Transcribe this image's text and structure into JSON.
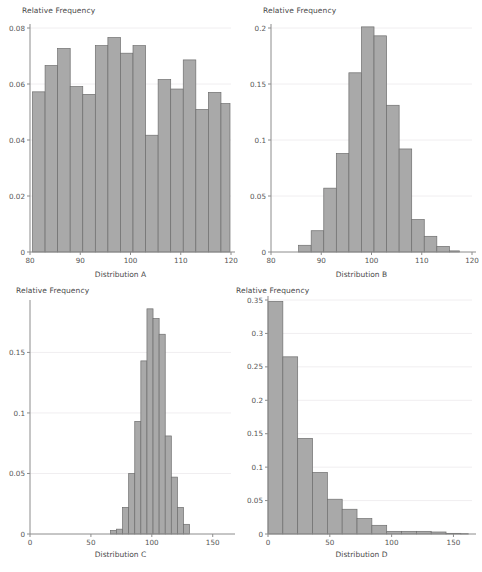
{
  "figure": {
    "background": "#ffffff",
    "bar_fill": "#a9a9a9",
    "bar_stroke": "#6e6e6e",
    "axis_color": "#8c8c8c",
    "grid_color": "#f0eef0",
    "text_color": "#4a4a4a",
    "layout": "2x2 grid of histograms"
  },
  "chart_data": [
    {
      "id": "A",
      "type": "bar",
      "title": "",
      "xlabel": "Distribution A",
      "ylabel": "Relative Frequency",
      "xlim": [
        80,
        120
      ],
      "ylim": [
        0,
        0.08
      ],
      "xticks": [
        80,
        90,
        100,
        110,
        120
      ],
      "xtick_labels": [
        "80",
        "90",
        "100",
        "110",
        "120"
      ],
      "yticks": [
        0,
        0.02,
        0.04,
        0.06,
        0.08
      ],
      "ytick_labels": [
        "0",
        "0.02",
        "0.04",
        "0.06",
        "0.08"
      ],
      "grid": true,
      "shape": "uniform",
      "bin_edges": [
        80.5,
        83,
        85.5,
        88,
        90.5,
        93,
        95.5,
        98,
        100.5,
        103,
        105.5,
        108,
        110.5,
        113,
        115.5,
        118,
        119.8
      ],
      "categories": [
        "80.5-83",
        "83-85.5",
        "85.5-88",
        "88-90.5",
        "90.5-93",
        "93-95.5",
        "95.5-98",
        "98-100.5",
        "100.5-103",
        "103-105.5",
        "105.5-108",
        "108-110.5",
        "110.5-113",
        "113-115.5",
        "115.5-118",
        "118-119.8"
      ],
      "values": [
        0.0572,
        0.0666,
        0.0727,
        0.0591,
        0.0563,
        0.0737,
        0.0766,
        0.071,
        0.0737,
        0.0417,
        0.0616,
        0.0582,
        0.0686,
        0.0509,
        0.057,
        0.053
      ]
    },
    {
      "id": "B",
      "type": "bar",
      "title": "",
      "xlabel": "Distribution B",
      "ylabel": "Relative Frequency",
      "xlim": [
        80,
        120
      ],
      "ylim": [
        0,
        0.2
      ],
      "xticks": [
        80,
        90,
        100,
        110,
        120
      ],
      "xtick_labels": [
        "80",
        "90",
        "100",
        "110",
        "120"
      ],
      "yticks": [
        0,
        0.05,
        0.1,
        0.15,
        0.2
      ],
      "ytick_labels": [
        "0",
        "0.05",
        "0.1",
        "0.15",
        "0.2"
      ],
      "grid": true,
      "shape": "normal-bell",
      "bin_edges": [
        85.5,
        88,
        90.5,
        93,
        95.5,
        98,
        100.5,
        103,
        105.5,
        108,
        110.5,
        113,
        115.5,
        117.5
      ],
      "categories": [
        "85.5-88",
        "88-90.5",
        "90.5-93",
        "93-95.5",
        "95.5-98",
        "98-100.5",
        "100.5-103",
        "103-105.5",
        "105.5-108",
        "108-110.5",
        "110.5-113",
        "113-115.5",
        "115.5-117.5"
      ],
      "values": [
        0.006,
        0.019,
        0.057,
        0.088,
        0.16,
        0.201,
        0.193,
        0.131,
        0.092,
        0.029,
        0.014,
        0.005,
        0.001
      ]
    },
    {
      "id": "C",
      "type": "bar",
      "title": "",
      "xlabel": "Distribution C",
      "ylabel": "Relative Frequency",
      "xlim": [
        0,
        165
      ],
      "ylim": [
        0,
        0.19
      ],
      "xticks": [
        0,
        50,
        100,
        150
      ],
      "xtick_labels": [
        "0",
        "50",
        "100",
        "150"
      ],
      "yticks": [
        0,
        0.05,
        0.1,
        0.15
      ],
      "ytick_labels": [
        "0",
        "0.05",
        "0.1",
        "0.15"
      ],
      "grid": true,
      "shape": "narrow-peaked",
      "bin_edges": [
        66,
        71,
        76,
        81,
        86,
        91,
        96,
        101,
        106,
        111,
        116,
        121,
        126,
        131
      ],
      "categories": [
        "66-71",
        "71-76",
        "76-81",
        "81-86",
        "86-91",
        "91-96",
        "96-101",
        "101-106",
        "106-111",
        "111-116",
        "116-121",
        "121-126",
        "126-131"
      ],
      "values": [
        0.003,
        0.004,
        0.022,
        0.05,
        0.093,
        0.143,
        0.186,
        0.178,
        0.165,
        0.081,
        0.047,
        0.022,
        0.008
      ]
    },
    {
      "id": "D",
      "type": "bar",
      "title": "",
      "xlabel": "Distribution D",
      "ylabel": "Relative Frequency",
      "xlim": [
        0,
        165
      ],
      "ylim": [
        0,
        0.35
      ],
      "xticks": [
        0,
        50,
        100,
        150
      ],
      "xtick_labels": [
        "0",
        "50",
        "100",
        "150"
      ],
      "yticks": [
        0,
        0.05,
        0.1,
        0.15,
        0.2,
        0.25,
        0.3,
        0.35
      ],
      "ytick_labels": [
        "0",
        "0.05",
        "0.1",
        "0.15",
        "0.2",
        "0.25",
        "0.3",
        "0.35"
      ],
      "grid": true,
      "shape": "exponential-right-skewed",
      "bin_edges": [
        0,
        12,
        24,
        36,
        48,
        60,
        72,
        84,
        96,
        108,
        120,
        132,
        144,
        156,
        162
      ],
      "categories": [
        "0-12",
        "12-24",
        "24-36",
        "36-48",
        "48-60",
        "60-72",
        "72-84",
        "84-96",
        "96-108",
        "108-120",
        "120-132",
        "132-144",
        "144-156",
        "156-162"
      ],
      "values": [
        0.348,
        0.265,
        0.143,
        0.092,
        0.052,
        0.037,
        0.023,
        0.013,
        0.004,
        0.004,
        0.004,
        0.003,
        0.001,
        0.0005
      ]
    }
  ]
}
